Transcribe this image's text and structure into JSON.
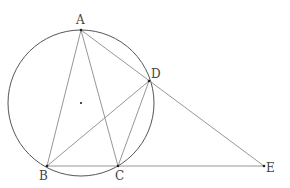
{
  "diagram": {
    "type": "geometry",
    "colors": {
      "circle": "#555555",
      "lines": "#8a8a8a",
      "points": "#222222",
      "labels": "#444444"
    },
    "circle": {
      "cx": 81,
      "cy": 103,
      "r": 73
    },
    "center_dot": {
      "x": 81,
      "y": 103
    },
    "points": {
      "A": {
        "label": "A",
        "x": 81,
        "y": 30,
        "lx": 76,
        "ly": 24
      },
      "B": {
        "label": "B",
        "x": 47,
        "y": 166,
        "lx": 39,
        "ly": 180
      },
      "C": {
        "label": "C",
        "x": 118,
        "y": 166,
        "lx": 115,
        "ly": 180
      },
      "D": {
        "label": "D",
        "x": 149,
        "y": 81,
        "lx": 151,
        "ly": 78
      },
      "E": {
        "label": "E",
        "x": 264,
        "y": 166,
        "lx": 266,
        "ly": 172
      }
    },
    "segments": [
      [
        "A",
        "B"
      ],
      [
        "A",
        "C"
      ],
      [
        "A",
        "E"
      ],
      [
        "B",
        "D"
      ],
      [
        "C",
        "D"
      ],
      [
        "B",
        "E"
      ]
    ]
  }
}
